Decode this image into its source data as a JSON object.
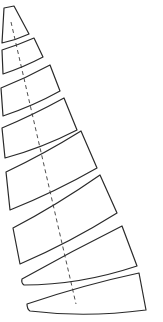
{
  "diagram": {
    "type": "sail-panel-layout",
    "background": "#ffffff",
    "stroke_color": "#2a2a2a",
    "panel_count": 8,
    "panels": [
      {
        "id": 1,
        "d": "M4,8 L14,6 L29,34 Q16,40 2,43 Z"
      },
      {
        "id": 2,
        "d": "M2,50 Q18,45 34,38 L43,57 Q24,67 3,74 Z"
      },
      {
        "id": 3,
        "d": "M1,88 Q26,78 50,65 L60,91 Q33,106 3,116 Z"
      },
      {
        "id": 4,
        "d": "M2,128 Q33,115 64,98 L77,130 Q42,148 5,158 Z"
      },
      {
        "id": 5,
        "d": "M6,172 Q44,154 81,131 L97,168 Q55,192 10,210 Z"
      },
      {
        "id": 6,
        "d": "M13,228 Q57,205 100,175 L117,213 Q69,243 20,264 Z"
      },
      {
        "id": 7,
        "d": "M22,279 Q72,251 122,226 L137,266 Q80,285 24,285 Q21,283 22,279 Z"
      },
      {
        "id": 8,
        "d": "M27,304 Q83,285 139,273 L146,310 Q86,318 30,311 Q27,309 27,304 Z"
      }
    ],
    "center_axis": {
      "x1": 11,
      "y1": 22,
      "x2": 76,
      "y2": 304,
      "style": "dashed"
    }
  }
}
